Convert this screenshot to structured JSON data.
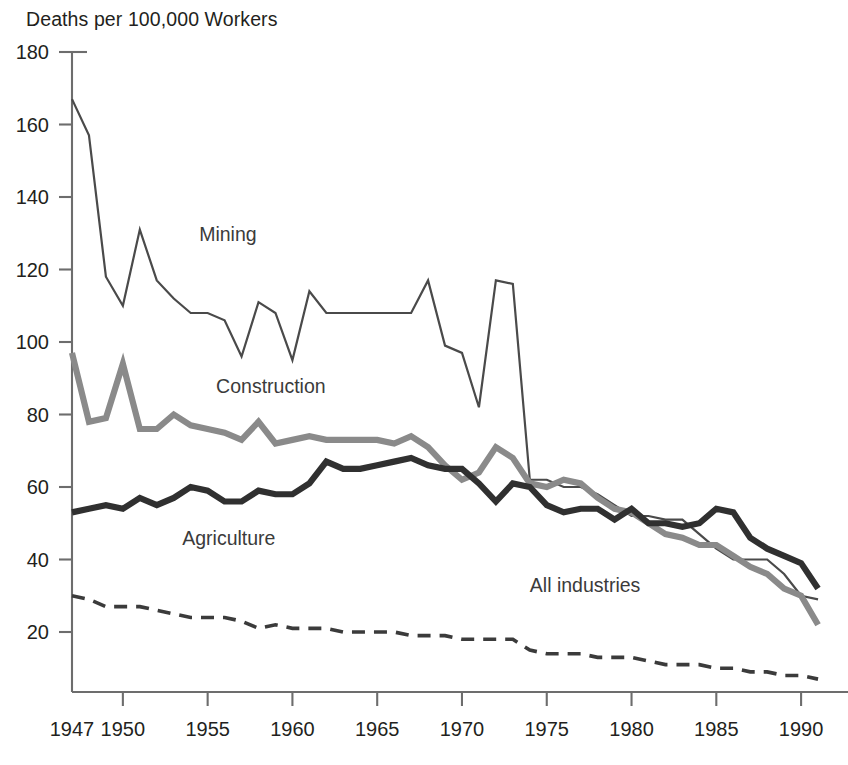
{
  "chart_data": {
    "type": "line",
    "title": "",
    "ylabel": "Deaths per 100,000 Workers",
    "xlabel": "",
    "ylim": [
      0,
      180
    ],
    "xlim": [
      1947,
      1992
    ],
    "grid": false,
    "legend_position": "inline-labels",
    "ytick_labels": [
      "180",
      "160",
      "140",
      "120",
      "100",
      "80",
      "60",
      "40",
      "20"
    ],
    "ytick_values": [
      180,
      160,
      140,
      120,
      100,
      80,
      60,
      40,
      20
    ],
    "xtick_labels": [
      "1947",
      "1950",
      "1955",
      "1960",
      "1965",
      "1970",
      "1975",
      "1980",
      "1985",
      "1990"
    ],
    "xtick_values": [
      1947,
      1950,
      1955,
      1960,
      1965,
      1970,
      1975,
      1980,
      1985,
      1990
    ],
    "x": [
      1947,
      1948,
      1949,
      1950,
      1951,
      1952,
      1953,
      1954,
      1955,
      1956,
      1957,
      1958,
      1959,
      1960,
      1961,
      1962,
      1963,
      1964,
      1965,
      1966,
      1967,
      1968,
      1969,
      1970,
      1971,
      1972,
      1973,
      1974,
      1975,
      1976,
      1977,
      1978,
      1979,
      1980,
      1981,
      1982,
      1983,
      1984,
      1985,
      1986,
      1987,
      1988,
      1989,
      1990,
      1991
    ],
    "series": [
      {
        "name": "Mining",
        "style": "thin-solid",
        "color": "#4a4a4a",
        "width": 2.2,
        "values": [
          167,
          157,
          118,
          110,
          131,
          117,
          112,
          108,
          108,
          106,
          96,
          111,
          108,
          95,
          114,
          108,
          108,
          108,
          108,
          108,
          108,
          117,
          99,
          97,
          82,
          117,
          116,
          62,
          62,
          60,
          60,
          58,
          55,
          52,
          52,
          51,
          51,
          47,
          43,
          40,
          40,
          40,
          36,
          30,
          29
        ]
      },
      {
        "name": "Construction",
        "style": "thick-gray",
        "color": "#8a8a8a",
        "width": 6.2,
        "values": [
          97,
          78,
          79,
          94,
          76,
          76,
          80,
          77,
          76,
          75,
          73,
          78,
          72,
          73,
          74,
          73,
          73,
          73,
          73,
          72,
          74,
          71,
          66,
          62,
          64,
          71,
          68,
          61,
          60,
          62,
          61,
          57,
          54,
          53,
          50,
          47,
          46,
          44,
          44,
          41,
          38,
          36,
          32,
          30,
          22
        ]
      },
      {
        "name": "Agriculture",
        "style": "thick-dark",
        "color": "#303030",
        "width": 6.2,
        "values": [
          53,
          54,
          55,
          54,
          57,
          55,
          57,
          60,
          59,
          56,
          56,
          59,
          58,
          58,
          61,
          67,
          65,
          65,
          66,
          67,
          68,
          66,
          65,
          65,
          61,
          56,
          61,
          60,
          55,
          53,
          54,
          54,
          51,
          54,
          50,
          50,
          49,
          50,
          54,
          53,
          46,
          43,
          41,
          39,
          32
        ]
      },
      {
        "name": "All industries",
        "style": "dashed",
        "color": "#3b3b3b",
        "width": 3.6,
        "values": [
          30,
          29,
          27,
          27,
          27,
          26,
          25,
          24,
          24,
          24,
          23,
          21,
          22,
          21,
          21,
          21,
          20,
          20,
          20,
          20,
          19,
          19,
          19,
          18,
          18,
          18,
          18,
          15,
          14,
          14,
          14,
          13,
          13,
          13,
          12,
          11,
          11,
          11,
          10,
          10,
          9,
          9,
          8,
          8,
          7
        ]
      }
    ],
    "annotations": [
      {
        "text": "Mining",
        "x": 1954.5,
        "y": 128
      },
      {
        "text": "Construction",
        "x": 1955.5,
        "y": 86
      },
      {
        "text": "Agriculture",
        "x": 1953.5,
        "y": 44
      },
      {
        "text": "All industries",
        "x": 1974.0,
        "y": 31
      }
    ]
  }
}
